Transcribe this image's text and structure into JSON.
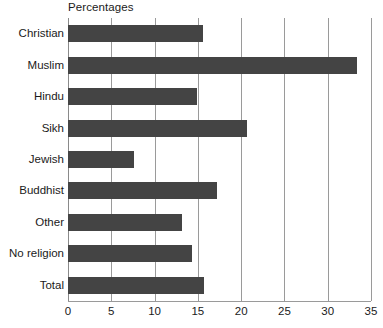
{
  "chart_data": {
    "type": "bar",
    "orientation": "horizontal",
    "title": "Percentages",
    "xlabel": "",
    "ylabel": "",
    "xlim": [
      0,
      35
    ],
    "xticks": [
      0,
      5,
      10,
      15,
      20,
      25,
      30,
      35
    ],
    "xtick_labels": [
      "0",
      "5",
      "10",
      "15",
      "20",
      "25",
      "30",
      "35"
    ],
    "grid": true,
    "legend": false,
    "bar_color": "#444444",
    "gridline_color": "#9a9a9a",
    "background": "#ffffff",
    "categories": [
      "Christian",
      "Muslim",
      "Hindu",
      "Sikh",
      "Jewish",
      "Buddhist",
      "Other",
      "No religion",
      "Total"
    ],
    "values": [
      15.6,
      33.4,
      14.9,
      20.7,
      7.6,
      17.2,
      13.2,
      14.3,
      15.7
    ]
  }
}
